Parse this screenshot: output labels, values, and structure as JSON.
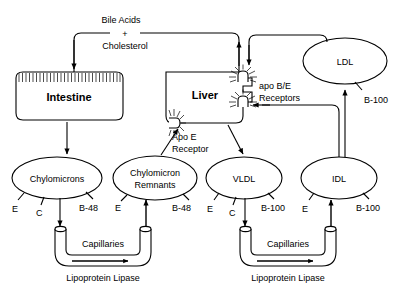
{
  "diagram": {
    "organs": [
      {
        "id": "intestine",
        "label": "Intestine"
      },
      {
        "id": "liver",
        "label": "Liver"
      }
    ],
    "top_pathway": {
      "line1": "Bile Acids",
      "plus": "+",
      "line2": "Cholesterol"
    },
    "receptors": [
      {
        "id": "apo-e-receptor",
        "line1": "Apo E",
        "line2": "Receptor"
      },
      {
        "id": "apo-be-receptors",
        "line1": "apo B/E",
        "line2": "Receptors"
      }
    ],
    "particles": [
      {
        "id": "chylomicrons",
        "line1": "Chylomicrons",
        "line2": "",
        "apos": [
          "E",
          "C",
          "B-48"
        ]
      },
      {
        "id": "chylomicron-remnants",
        "line1": "Chylomicron",
        "line2": "Remnants",
        "apos": [
          "E",
          "B-48"
        ]
      },
      {
        "id": "vldl",
        "line1": "VLDL",
        "line2": "",
        "apos": [
          "E",
          "C",
          "B-100"
        ]
      },
      {
        "id": "idl",
        "line1": "IDL",
        "line2": "",
        "apos": [
          "E",
          "B-100"
        ]
      },
      {
        "id": "ldl",
        "line1": "LDL",
        "line2": "",
        "apos": [
          "B-100"
        ]
      }
    ],
    "capillary_beds": [
      {
        "id": "capillary-bed-left",
        "label": "Capillaries",
        "enzyme": "Lipoprotein Lipase"
      },
      {
        "id": "capillary-bed-right",
        "label": "Capillaries",
        "enzyme": "Lipoprotein Lipase"
      }
    ],
    "colors": {
      "background": "#ffffff",
      "stroke": "#000000",
      "text": "#000000"
    }
  }
}
